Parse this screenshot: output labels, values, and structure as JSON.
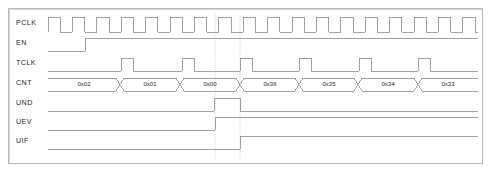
{
  "diagram": {
    "type": "digital-timing-waveform",
    "frame": {
      "x": 8,
      "y": 8,
      "width": 475,
      "height": 156,
      "border_color": "#b9b9bb"
    },
    "background_color": "#ffffff",
    "wave_color": "#8a8a8f",
    "text_color": "#231f20",
    "marker_color": "#c9c9d4",
    "time_axis": {
      "left": 48,
      "right": 478,
      "clock_period": 24.4,
      "clock_start": 48,
      "unit": "PCLK cycle"
    },
    "signals": [
      {
        "name": "PCLK",
        "label": "PCLK",
        "label_x": 16,
        "row_y_high": 17,
        "row_y_low": 32,
        "type": "clock",
        "description": "Free running prescaler clock, 18 cycles shown",
        "cycles": 18,
        "duty": 0.5
      },
      {
        "name": "EN",
        "label": "EN",
        "label_x": 16,
        "row_y_high": 38,
        "row_y_low": 51,
        "type": "level",
        "description": "Counter enable, asserted high after second PCLK cycle",
        "transitions": [
          {
            "x": 48,
            "level": 0
          },
          {
            "x": 85,
            "level": 1
          },
          {
            "x": 478,
            "level": 1
          }
        ]
      },
      {
        "name": "TCLK",
        "label": "TCLK",
        "label_x": 16,
        "row_y_high": 58,
        "row_y_low": 71,
        "type": "pulse-train",
        "description": "Divided timer clock, 6 narrow pulses",
        "pulses": [
          {
            "rise": 121,
            "fall": 133
          },
          {
            "rise": 182,
            "fall": 194
          },
          {
            "rise": 240,
            "fall": 252
          },
          {
            "rise": 299,
            "fall": 311
          },
          {
            "rise": 359,
            "fall": 371
          },
          {
            "rise": 418,
            "fall": 430
          }
        ]
      },
      {
        "name": "CNT",
        "label": "CNT",
        "label_x": 16,
        "row_y_high": 78,
        "row_y_low": 91,
        "type": "bus",
        "description": "Counter register value, counts down then reloads",
        "segments": [
          {
            "value": "0x02",
            "start": 48,
            "end": 120
          },
          {
            "value": "0x01",
            "start": 120,
            "end": 180
          },
          {
            "value": "0x00",
            "start": 180,
            "end": 240
          },
          {
            "value": "0x36",
            "start": 240,
            "end": 299
          },
          {
            "value": "0x35",
            "start": 299,
            "end": 358
          },
          {
            "value": "0x34",
            "start": 358,
            "end": 418
          },
          {
            "value": "0x33",
            "start": 418,
            "end": 478
          }
        ]
      },
      {
        "name": "UND",
        "label": "UND",
        "label_x": 16,
        "row_y_high": 98,
        "row_y_low": 111,
        "type": "pulse",
        "description": "Underflow pulse, high for one TCLK period",
        "transitions": [
          {
            "x": 48,
            "level": 0
          },
          {
            "x": 214,
            "level": 1
          },
          {
            "x": 240,
            "level": 0
          },
          {
            "x": 478,
            "level": 0
          }
        ]
      },
      {
        "name": "UEV",
        "label": "UEV",
        "label_x": 16,
        "row_y_high": 117,
        "row_y_low": 130,
        "type": "level",
        "description": "Update event, asserted at underflow and stays high",
        "transitions": [
          {
            "x": 48,
            "level": 0
          },
          {
            "x": 215,
            "level": 1
          },
          {
            "x": 478,
            "level": 1
          }
        ]
      },
      {
        "name": "UIF",
        "label": "UIF",
        "label_x": 16,
        "row_y_high": 136,
        "row_y_low": 149,
        "type": "level",
        "description": "Update interrupt flag, set one cycle after update event",
        "transitions": [
          {
            "x": 48,
            "level": 0
          },
          {
            "x": 240,
            "level": 1
          },
          {
            "x": 478,
            "level": 1
          }
        ]
      }
    ],
    "markers": [
      {
        "name": "underflow-marker",
        "x": 215,
        "y_top": 14,
        "y_bottom": 160,
        "style": "dashed"
      },
      {
        "name": "reload-marker",
        "x": 240,
        "y_top": 14,
        "y_bottom": 160,
        "style": "dashed"
      }
    ]
  }
}
